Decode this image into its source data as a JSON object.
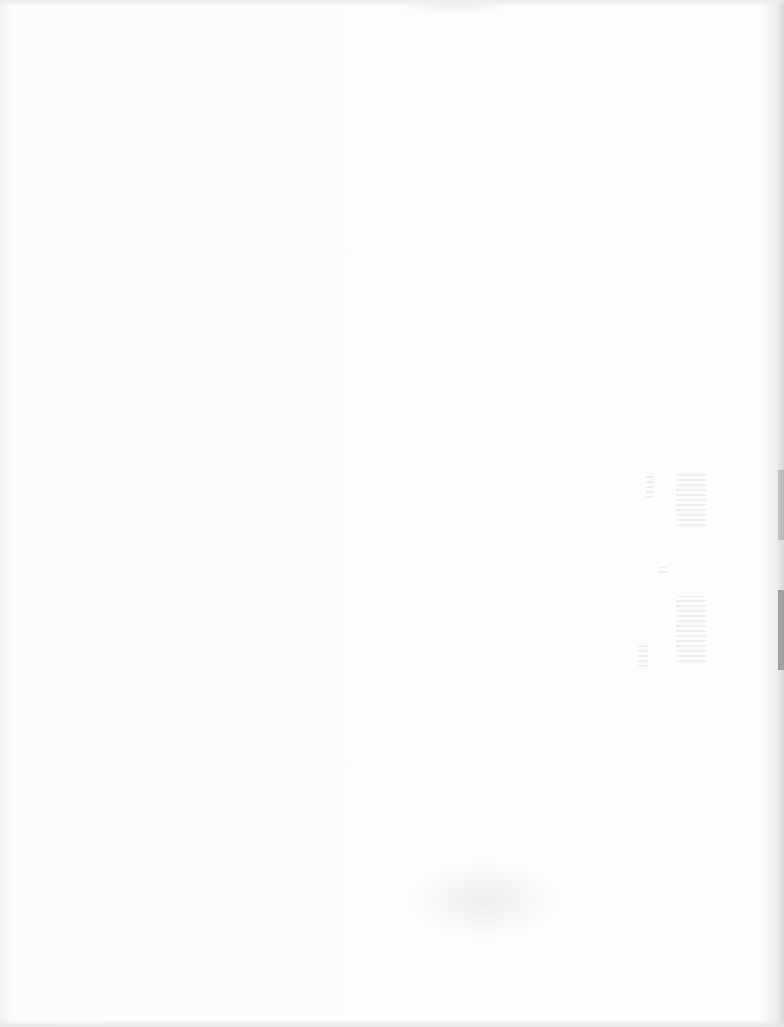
{
  "document": {
    "type": "scanned-blank-page",
    "text": "",
    "colors": {
      "paper": "#fbfbfa",
      "edge_shadow": "#d8d8d6",
      "bleed_through": "#9a9a96"
    }
  }
}
